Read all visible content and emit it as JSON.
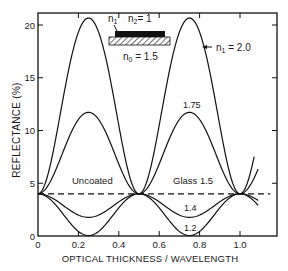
{
  "chart_data": {
    "type": "line",
    "title": "",
    "xlabel": "OPTICAL THICKNESS / WAVELENGTH",
    "ylabel": "REFLECTANCE (%)",
    "xlim": [
      0,
      1.18
    ],
    "ylim": [
      0,
      21
    ],
    "x_ticks": [
      "0",
      "0.2",
      "0.4",
      "0.6",
      "0.8",
      "1.0"
    ],
    "y_ticks": [
      "0",
      "5",
      "10",
      "15",
      "20"
    ],
    "grid": false,
    "substrate_index": 1.5,
    "series": [
      {
        "name": "n1 = 2.0",
        "label": "n₁ = 2.0",
        "n1": 2.0,
        "peak_reflectance": 20.7,
        "peak_x": [
          0.25,
          0.75
        ]
      },
      {
        "name": "1.75",
        "label": "1.75",
        "n1": 1.75,
        "peak_reflectance": 11.7,
        "peak_x": [
          0.25,
          0.75
        ]
      },
      {
        "name": "Uncoated / Glass 1.5",
        "label": "Uncoated",
        "n1": 1.5,
        "value": 4.0,
        "style": "dashed"
      },
      {
        "name": "1.4",
        "label": "1.4",
        "n1": 1.4,
        "min_reflectance": 1.8,
        "min_x": [
          0.25,
          0.75
        ]
      },
      {
        "name": "1.2",
        "label": "1.2",
        "n1": 1.2,
        "min_reflectance": 0.0,
        "min_x": [
          0.25,
          0.75
        ]
      }
    ],
    "annotations": [
      {
        "text": "Uncoated",
        "x": 0.17,
        "y": 4.9
      },
      {
        "text": "Glass 1.5",
        "x": 0.77,
        "y": 4.9
      },
      {
        "text": "1.75",
        "x": 0.71,
        "y": 12.3
      },
      {
        "text": "1.4",
        "x": 0.72,
        "y": 2.6
      },
      {
        "text": "1.2",
        "x": 0.72,
        "y": 0.7
      },
      {
        "text": "n₁ = 2.0",
        "x": 0.95,
        "y": 17.5
      }
    ],
    "inset": {
      "n1_label": "n",
      "n1_sub": "1",
      "n2_label": "n",
      "n2_sub": "2",
      "n2_value": "= 1",
      "n0_label": "n",
      "n0_sub": "0",
      "n0_value": "= 1.5"
    }
  }
}
